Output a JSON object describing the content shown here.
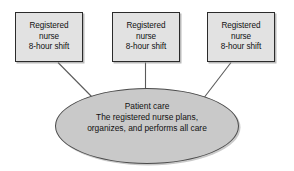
{
  "diagram": {
    "type": "organizational-flow-diagram",
    "background_color": "#ffffff",
    "node_fill_color": "#e2e2e2",
    "hub_fill_color": "#c9c9c9",
    "border_color": "#2b2b2b",
    "connector_color": "#555555",
    "nodes": [
      {
        "id": "box-1",
        "shape": "rectangle",
        "lines": [
          "Registered",
          "nurse",
          "8-hour shift"
        ]
      },
      {
        "id": "box-2",
        "shape": "rectangle",
        "lines": [
          "Registered",
          "nurse",
          "8-hour shift"
        ]
      },
      {
        "id": "box-3",
        "shape": "rectangle",
        "lines": [
          "Registered",
          "nurse",
          "8-hour shift"
        ]
      }
    ],
    "hub": {
      "id": "care-ellipse",
      "shape": "ellipse",
      "lines": [
        "Patient care",
        "The registered nurse plans,",
        "organizes, and performs all care"
      ]
    },
    "connectors": [
      {
        "id": "connector-left",
        "from": "box-1",
        "to": "care-ellipse",
        "style": "diagonal"
      },
      {
        "id": "connector-middle",
        "from": "box-2",
        "to": "care-ellipse",
        "style": "vertical"
      },
      {
        "id": "connector-right",
        "from": "box-3",
        "to": "care-ellipse",
        "style": "diagonal"
      }
    ]
  }
}
